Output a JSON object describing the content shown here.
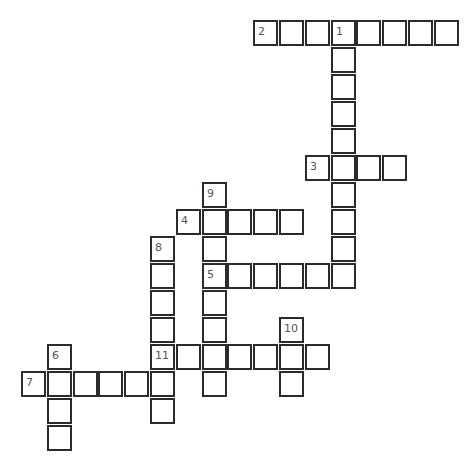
{
  "puzzle": {
    "type": "crossword",
    "grid_origin": {
      "x": 21,
      "y": 20
    },
    "pitch": {
      "x": 25.8,
      "y": 27
    },
    "colors": {
      "border": "#2b2b2b",
      "number": "#555555",
      "background": "#ffffff"
    },
    "words": [
      {
        "number": "1",
        "direction": "down",
        "col": 12,
        "row": 0,
        "length": 10
      },
      {
        "number": "2",
        "direction": "across",
        "col": 9,
        "row": 0,
        "length": 8
      },
      {
        "number": "3",
        "direction": "across",
        "col": 11,
        "row": 5,
        "length": 4
      },
      {
        "number": "4",
        "direction": "across",
        "col": 6,
        "row": 7,
        "length": 5
      },
      {
        "number": "5",
        "direction": "across",
        "col": 7,
        "row": 9,
        "length": 6
      },
      {
        "number": "6",
        "direction": "down",
        "col": 1,
        "row": 12,
        "length": 4
      },
      {
        "number": "7",
        "direction": "across",
        "col": 0,
        "row": 13,
        "length": 6
      },
      {
        "number": "8",
        "direction": "down",
        "col": 5,
        "row": 8,
        "length": 7
      },
      {
        "number": "9",
        "direction": "down",
        "col": 7,
        "row": 6,
        "length": 8
      },
      {
        "number": "10",
        "direction": "down",
        "col": 10,
        "row": 11,
        "length": 3
      },
      {
        "number": "11",
        "direction": "across",
        "col": 5,
        "row": 12,
        "length": 7
      }
    ]
  }
}
